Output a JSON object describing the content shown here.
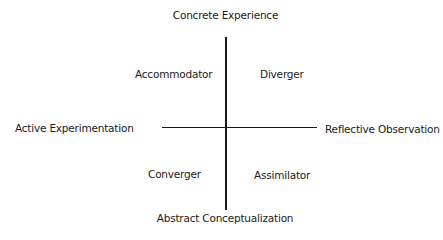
{
  "diagram": {
    "type": "quadrant",
    "axes": {
      "top": "Concrete Experience",
      "bottom": "Abstract Conceptualization",
      "left": "Active Experimentation",
      "right": "Reflective Observation"
    },
    "quadrants": {
      "top_left": "Accommodator",
      "top_right": "Diverger",
      "bottom_left": "Converger",
      "bottom_right": "Assimilator"
    },
    "colors": {
      "line": "#1a1a1a",
      "text": "#1a1a1a",
      "background": "#ffffff"
    }
  }
}
